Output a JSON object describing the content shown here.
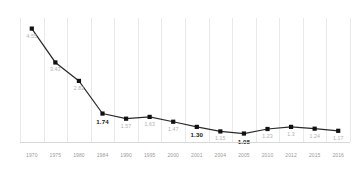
{
  "chart_data": {
    "type": "line",
    "title": "",
    "subtitle": "",
    "xlabel": "",
    "ylabel": "",
    "grid": "vertical",
    "legend": "none",
    "ylim": [
      0.8,
      4.9
    ],
    "categories": [
      "1970",
      "1975",
      "1980",
      "1984",
      "1990",
      "1995",
      "2000",
      "2001",
      "2004",
      "2005",
      "2010",
      "2012",
      "2015",
      "2016"
    ],
    "values": [
      4.55,
      3.43,
      2.82,
      1.74,
      1.57,
      1.63,
      1.47,
      1.3,
      1.15,
      1.08,
      1.23,
      1.3,
      1.24,
      1.17
    ],
    "point_labels": [
      "4.55",
      "3.43",
      "2.82",
      "1.74",
      "1.57",
      "1.63",
      "1.47",
      "1.30",
      "1.15",
      "1.08",
      "1.23",
      "1.3",
      "1.24",
      "1.17"
    ],
    "emphasis": [
      false,
      false,
      false,
      true,
      false,
      false,
      false,
      true,
      false,
      true,
      false,
      false,
      false,
      false
    ],
    "label_position": [
      "below",
      "below",
      "below",
      "below",
      "below",
      "below",
      "below",
      "below",
      "below",
      "below",
      "below",
      "below",
      "below",
      "below"
    ],
    "colors": {
      "line": "#2b2b2b",
      "marker": "#111111",
      "grid": "#e9e9e9",
      "label_light": "#b0b0b0",
      "label_bold": "#1a1a1a",
      "axis_tick": "#9a9a9a",
      "background": "#ffffff"
    }
  }
}
